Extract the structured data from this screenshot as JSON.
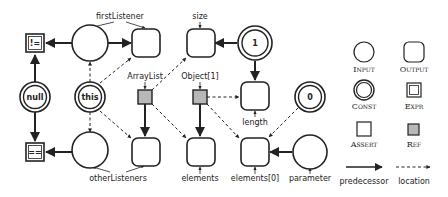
{
  "diagram": {
    "nodes": {
      "neq": "!=",
      "eq": "==",
      "null_const": "null",
      "this_const": "this",
      "one_const": "1",
      "zero_const": "0"
    },
    "labels": {
      "firstListener": "firstListener",
      "size": "size",
      "arraylist": "ArrayList",
      "object1": "Object[1]",
      "length": "length",
      "otherListeners": "otherListeners",
      "elements": "elements",
      "elements0": "elements[0]",
      "parameter": "parameter"
    }
  },
  "legend": {
    "input": "Input",
    "output": "Output",
    "const": "Const",
    "expr": "Expr",
    "assert": "Assert",
    "ref": "Ref",
    "predecessor": "predecessor",
    "location": "location"
  },
  "colors": {
    "stroke": "#222222",
    "ref_fill": "#b8b8b8"
  }
}
